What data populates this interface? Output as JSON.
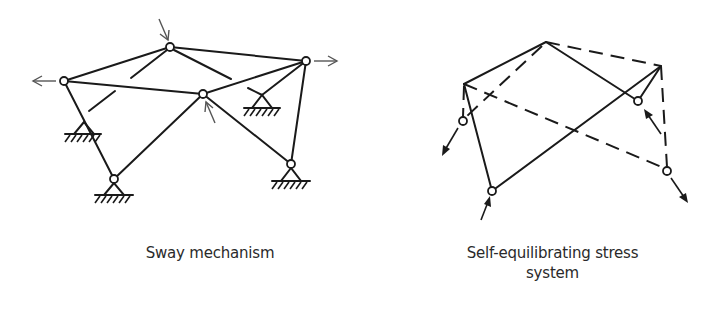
{
  "figure": {
    "left_panel": {
      "caption": "Sway mechanism",
      "nodes": [
        {
          "id": "top",
          "x": 170,
          "y": 47
        },
        {
          "id": "left",
          "x": 64,
          "y": 81
        },
        {
          "id": "right",
          "x": 306,
          "y": 61
        },
        {
          "id": "center",
          "x": 203,
          "y": 94
        },
        {
          "id": "bottom-left",
          "x": 114,
          "y": 179
        },
        {
          "id": "bottom-right",
          "x": 291,
          "y": 164
        }
      ],
      "supports": [
        "bottom-left",
        "bottom-right",
        "mid-left",
        "mid-right"
      ],
      "loads": [
        "down at top node",
        "left at left node",
        "right at right node",
        "up at center node"
      ]
    },
    "right_panel": {
      "caption": "Self-equilibrating stress system",
      "caption_line1": "Self-equilibrating stress",
      "caption_line2": "system",
      "line_styles": [
        "solid",
        "dashed"
      ],
      "loads": [
        "down-left at lower-left node",
        "up at bottom node",
        "up-left at inner-right node",
        "down-right at far-right node"
      ]
    }
  }
}
